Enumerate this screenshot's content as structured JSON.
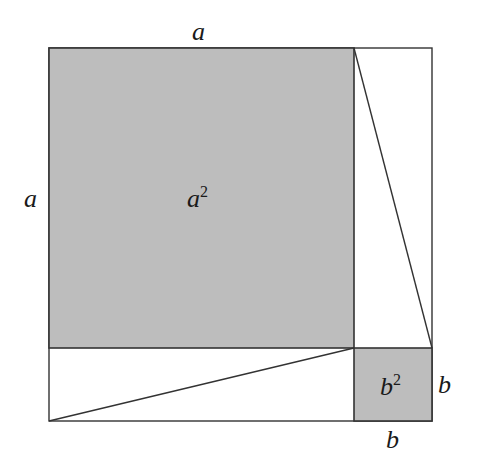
{
  "diagram": {
    "colors": {
      "background": "#ffffff",
      "fill": "#bdbdbd",
      "stroke": "#333333",
      "text": "#1a1a1a"
    },
    "outer_square": {
      "x": 49,
      "y": 48,
      "w": 383,
      "h": 373
    },
    "square_a": {
      "x": 49,
      "y": 48,
      "w": 305,
      "h": 300,
      "label": "a",
      "label_sup": "2"
    },
    "square_b": {
      "x": 354,
      "y": 348,
      "w": 78,
      "h": 73,
      "label": "b",
      "label_sup": "2"
    },
    "triangles": [
      {
        "name": "right-triangle",
        "points": "354,48 432,48 432,348",
        "hypotenuse": "354,48 432,348"
      },
      {
        "name": "bottom-triangle",
        "points": "49,348 354,348 49,421",
        "hypotenuse": "49,421 354,348"
      }
    ],
    "labels": {
      "top_a": "a",
      "left_a": "a",
      "right_b": "b",
      "bottom_b": "b"
    }
  }
}
